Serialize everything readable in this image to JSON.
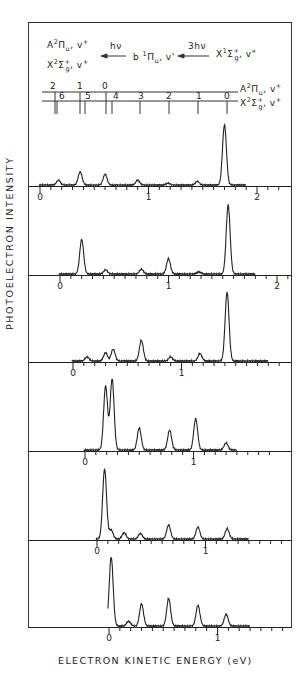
{
  "figure": {
    "y_axis_label": "PHOTOELECTRON  INTENSITY",
    "x_axis_label": "ELECTRON  KINETIC  ENERGY (eV)",
    "scheme": {
      "final_state_1": "A²Πu, v⁺",
      "final_state_2": "X²Σg⁺, v⁺",
      "arrow_1": "hν",
      "intermediate": "b¹Πu, v'",
      "arrow_2": "3hν",
      "initial": "X¹Σg⁺, v\""
    },
    "ladder": {
      "A_state_label": "A²Πu, v⁺",
      "X_state_label": "X²Σg⁺, v⁺",
      "A_levels": [
        "2",
        "1",
        "0"
      ],
      "X_levels": [
        "6",
        "5",
        "4",
        "3",
        "2",
        "1",
        "0"
      ]
    }
  },
  "chart_data": {
    "type": "line",
    "xlabel": "ELECTRON KINETIC ENERGY (eV)",
    "ylabel": "PHOTOELECTRON INTENSITY",
    "grid": false,
    "legend": "none",
    "panels": [
      {
        "panel": 1,
        "x_ticks": [
          "0",
          "1",
          "2"
        ],
        "xlim": [
          0,
          1.9
        ],
        "peaks_eV": [
          0.17,
          0.37,
          0.6,
          0.9,
          1.18,
          1.45,
          1.7
        ],
        "relative_heights": [
          0.08,
          0.22,
          0.18,
          0.08,
          0.03,
          0.06,
          1.0
        ]
      },
      {
        "panel": 2,
        "x_ticks": [
          "0",
          "1",
          "2"
        ],
        "xlim": [
          0,
          1.8
        ],
        "peaks_eV": [
          0.2,
          0.42,
          0.75,
          1.0,
          1.28,
          1.55
        ],
        "relative_heights": [
          0.5,
          0.06,
          0.07,
          0.22,
          0.03,
          1.0
        ]
      },
      {
        "panel": 3,
        "x_ticks": [
          "0",
          "1"
        ],
        "xlim": [
          0,
          1.8
        ],
        "peaks_eV": [
          0.13,
          0.3,
          0.37,
          0.63,
          0.9,
          1.17,
          1.42
        ],
        "relative_heights": [
          0.06,
          0.12,
          0.17,
          0.3,
          0.06,
          0.11,
          1.0
        ]
      },
      {
        "panel": 4,
        "x_ticks": [
          "0",
          "1"
        ],
        "xlim": [
          0,
          1.4
        ],
        "peaks_eV": [
          0.19,
          0.25,
          0.5,
          0.78,
          1.02,
          1.3
        ],
        "relative_heights": [
          0.9,
          1.0,
          0.31,
          0.28,
          0.44,
          0.1
        ]
      },
      {
        "panel": 5,
        "x_ticks": [
          "0",
          "1"
        ],
        "xlim": [
          0,
          1.4
        ],
        "peaks_eV": [
          0.07,
          0.13,
          0.25,
          0.4,
          0.66,
          0.93,
          1.2
        ],
        "relative_heights": [
          1.0,
          0.13,
          0.09,
          0.08,
          0.2,
          0.17,
          0.15
        ]
      },
      {
        "panel": 6,
        "x_ticks": [
          "0",
          "1"
        ],
        "xlim": [
          0,
          1.3
        ],
        "peaks_eV": [
          0.02,
          0.18,
          0.3,
          0.55,
          0.82,
          1.08
        ],
        "relative_heights": [
          1.0,
          0.07,
          0.32,
          0.4,
          0.3,
          0.17
        ]
      }
    ]
  }
}
